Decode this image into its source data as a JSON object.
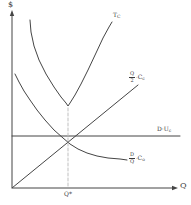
{
  "figure": {
    "y_axis_label": "$",
    "x_axis_label": "Q",
    "optimum_label": "Q*"
  },
  "labels": {
    "total_cost": {
      "main": "T",
      "sub": "C"
    },
    "carrying_cost": {
      "num": "Q",
      "den": "2",
      "op": "·",
      "coef": "C",
      "coef_sub": "c"
    },
    "purchase_cost": {
      "main": "D·U",
      "sub": "c"
    },
    "ordering_cost": {
      "num": "D",
      "den": "Q",
      "op": "·",
      "coef": "C",
      "coef_sub": "o"
    }
  },
  "colors": {
    "curve": "#454545",
    "dashed": "#bfbfbf",
    "text": "#3a3a3a",
    "background": "#ffffff"
  },
  "chart_data": {
    "type": "line",
    "title": "",
    "xlabel": "Q",
    "ylabel": "$",
    "optimum_x_label": "Q*",
    "note": "Qualitative EOQ cost diagram; no numeric scale shown. Points are canvas pixel coordinates (y down).",
    "series": [
      {
        "name": "total-cost-curve",
        "label": "TC",
        "dashed": false,
        "points": [
          [
            30,
            20
          ],
          [
            31,
            32
          ],
          [
            34,
            46
          ],
          [
            39,
            60
          ],
          [
            46,
            74
          ],
          [
            54,
            87
          ],
          [
            61,
            97
          ],
          [
            66,
            103
          ],
          [
            68,
            106
          ],
          [
            70,
            103
          ],
          [
            75,
            95
          ],
          [
            81,
            84
          ],
          [
            88,
            70
          ],
          [
            96,
            53
          ],
          [
            103,
            38
          ],
          [
            109,
            27
          ],
          [
            112,
            22
          ]
        ]
      },
      {
        "name": "carrying-cost-line",
        "label": "(Q/2)·Cc",
        "dashed": false,
        "points": [
          [
            12,
            188
          ],
          [
            138,
            85
          ]
        ]
      },
      {
        "name": "purchase-cost-line",
        "label": "D·Uc",
        "dashed": false,
        "points": [
          [
            12,
            136
          ],
          [
            180,
            136
          ]
        ]
      },
      {
        "name": "ordering-cost-curve",
        "label": "(D/Q)·Co",
        "dashed": false,
        "points": [
          [
            15,
            74
          ],
          [
            19,
            82
          ],
          [
            24,
            91
          ],
          [
            30,
            100
          ],
          [
            37,
            110
          ],
          [
            45,
            120
          ],
          [
            54,
            130
          ],
          [
            63,
            138
          ],
          [
            70,
            144
          ],
          [
            78,
            149
          ],
          [
            87,
            153
          ],
          [
            97,
            156
          ],
          [
            108,
            158
          ],
          [
            120,
            159
          ],
          [
            127,
            160
          ]
        ]
      },
      {
        "name": "optimum-dashed-line",
        "label": "Q*",
        "dashed": true,
        "points": [
          [
            68,
            108
          ],
          [
            68,
            187
          ]
        ]
      }
    ]
  }
}
